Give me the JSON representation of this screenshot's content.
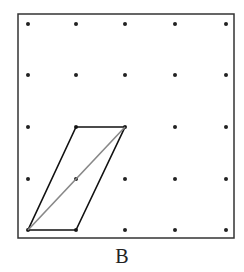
{
  "caption": "B",
  "grid": {
    "columns": 5,
    "rows": 5,
    "x": [
      28,
      76,
      125,
      175,
      226
    ],
    "y": [
      24,
      75,
      127,
      179,
      230
    ],
    "dot_color": "#222222"
  },
  "frame": {
    "x": 18,
    "y": 14,
    "width": 216,
    "height": 224,
    "stroke": "#333333"
  },
  "parallelogram": {
    "vertices_grid": [
      [
        0,
        4
      ],
      [
        1,
        4
      ],
      [
        2,
        2
      ],
      [
        1,
        2
      ]
    ],
    "stroke": "#111111"
  },
  "diagonal": {
    "from_grid": [
      0,
      4
    ],
    "to_grid": [
      2,
      2
    ],
    "stroke": "#888888"
  }
}
